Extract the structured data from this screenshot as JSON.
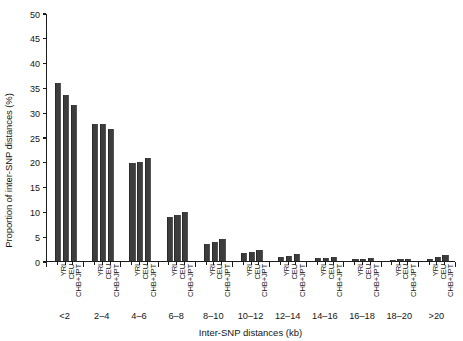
{
  "chart_data": {
    "type": "bar",
    "title": "",
    "xlabel": "Inter-SNP distances (kb)",
    "ylabel": "Proportion of inter-SNP distances (%)",
    "categories": [
      "<2",
      "2–4",
      "4–6",
      "6–8",
      "8–10",
      "10–12",
      "12–14",
      "14–16",
      "16–18",
      "18–20",
      ">20"
    ],
    "series": [
      {
        "name": "YRI",
        "values": [
          35.9,
          27.5,
          19.8,
          8.8,
          3.4,
          1.5,
          0.8,
          0.5,
          0.3,
          0.2,
          0.4
        ]
      },
      {
        "name": "CEU",
        "values": [
          33.5,
          27.5,
          20.0,
          9.2,
          3.7,
          1.7,
          1.0,
          0.6,
          0.4,
          0.3,
          0.8
        ]
      },
      {
        "name": "CHB+JPT",
        "values": [
          31.4,
          26.5,
          20.8,
          9.9,
          4.3,
          2.1,
          1.3,
          0.8,
          0.5,
          0.4,
          1.1
        ]
      }
    ],
    "yticks": [
      0,
      5,
      10,
      15,
      20,
      25,
      30,
      35,
      40,
      45,
      50
    ],
    "ylim": [
      0,
      50
    ],
    "grid": false,
    "legend": "none",
    "bar_color": "#3d3d3d",
    "axis_color": "#1c1c1c"
  }
}
